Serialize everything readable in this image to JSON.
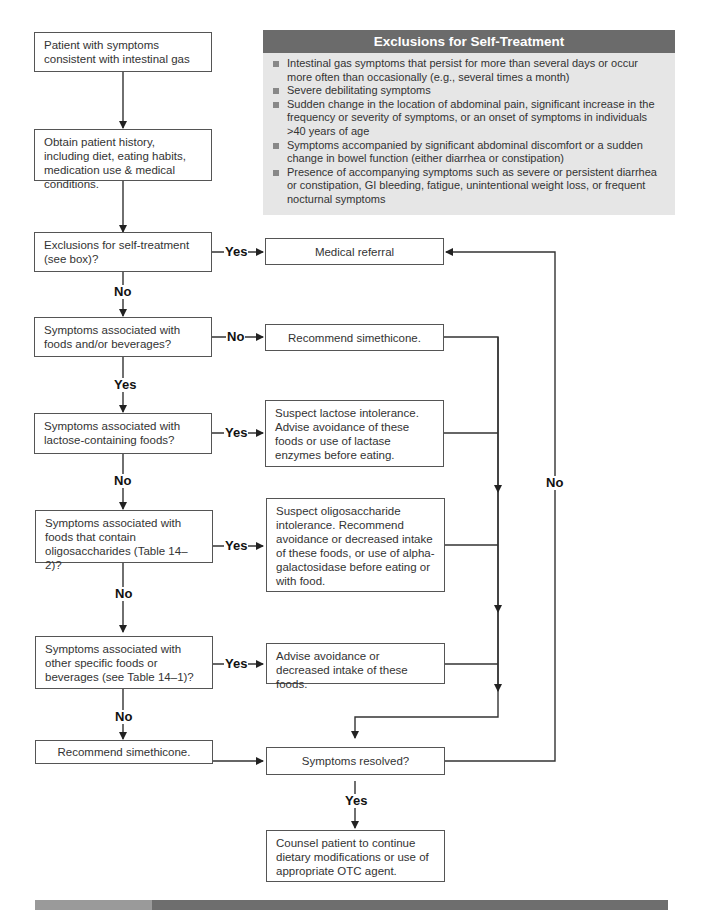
{
  "exclusions_panel": {
    "title": "Exclusions for Self-Treatment",
    "items": [
      "Intestinal gas symptoms that persist for more than several days or occur more often than occasionally (e.g., several times a month)",
      "Severe debilitating symptoms",
      "Sudden change in the location of abdominal pain, significant increase in the frequency or severity of symptoms, or an onset of symptoms in individuals >40 years of age",
      "Symptoms accompanied by significant abdominal discomfort or a sudden change in bowel function (either diarrhea or constipation)",
      "Presence of accompanying symptoms such as severe or persistent diarrhea or constipation, GI bleeding, fatigue, unintentional weight loss, or frequent nocturnal symptoms"
    ]
  },
  "nodes": {
    "start": "Patient with symptoms consistent with intestinal gas",
    "history": "Obtain patient history, including diet, eating habits, medication use & medical conditions.",
    "q_exclusions": "Exclusions for self-treatment (see box)?",
    "medical_referral": "Medical referral",
    "q_foods": "Symptoms associated with foods and/or beverages?",
    "simethicone_1": "Recommend simethicone.",
    "q_lactose": "Symptoms associated with lactose-containing foods?",
    "lactose_action": "Suspect lactose intolerance. Advise avoidance of these foods or use of lactase enzymes before eating.",
    "q_oligo": "Symptoms associated with foods that contain oligosaccharides (Table 14–2)?",
    "oligo_action": "Suspect oligosaccharide intolerance. Recommend avoidance or decreased intake of these foods, or use of alpha-galactosidase before eating or with food.",
    "q_other": "Symptoms associated with other specific foods or beverages (see Table 14–1)?",
    "other_action": "Advise avoidance or decreased intake of these foods.",
    "simethicone_2": "Recommend simethicone.",
    "q_resolved": "Symptoms resolved?",
    "counsel": "Counsel patient to continue dietary modifications or use of appropriate OTC agent."
  },
  "edge_labels": {
    "exclusions_yes": "Yes",
    "exclusions_no": "No",
    "foods_no": "No",
    "foods_yes": "Yes",
    "lactose_yes": "Yes",
    "lactose_no": "No",
    "oligo_yes": "Yes",
    "oligo_no": "No",
    "other_yes": "Yes",
    "other_no": "No",
    "resolved_yes": "Yes",
    "resolved_no": "No"
  },
  "colors": {
    "panel_header": "#6b6b6b",
    "panel_body": "#e6e6e6",
    "line": "#333333"
  }
}
